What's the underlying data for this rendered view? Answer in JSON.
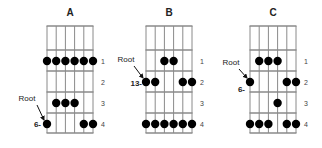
{
  "figure": {
    "colors": {
      "grid": "#8a8a8a",
      "dot": "#000000",
      "text": "#222222",
      "background": "#ffffff"
    },
    "diagrams": [
      {
        "title": "A",
        "fret_labels": [
          "1",
          "2",
          "3",
          "4"
        ],
        "root_label": "Root",
        "string_marker": "6-",
        "root": {
          "string": 1,
          "fret": 4
        },
        "dots": [
          {
            "string": 1,
            "fret": 1
          },
          {
            "string": 2,
            "fret": 1
          },
          {
            "string": 3,
            "fret": 1
          },
          {
            "string": 4,
            "fret": 1
          },
          {
            "string": 5,
            "fret": 1
          },
          {
            "string": 6,
            "fret": 1
          },
          {
            "string": 2,
            "fret": 3
          },
          {
            "string": 3,
            "fret": 3
          },
          {
            "string": 4,
            "fret": 3
          },
          {
            "string": 1,
            "fret": 4
          },
          {
            "string": 5,
            "fret": 4
          },
          {
            "string": 6,
            "fret": 4
          }
        ]
      },
      {
        "title": "B",
        "fret_labels": [
          "1",
          "2",
          "3",
          "4"
        ],
        "root_label": "Root",
        "string_marker": "13-",
        "root": {
          "string": 1,
          "fret": 2
        },
        "dots": [
          {
            "string": 3,
            "fret": 1
          },
          {
            "string": 4,
            "fret": 1
          },
          {
            "string": 1,
            "fret": 2
          },
          {
            "string": 2,
            "fret": 2
          },
          {
            "string": 5,
            "fret": 2
          },
          {
            "string": 6,
            "fret": 2
          },
          {
            "string": 1,
            "fret": 4
          },
          {
            "string": 2,
            "fret": 4
          },
          {
            "string": 3,
            "fret": 4
          },
          {
            "string": 4,
            "fret": 4
          },
          {
            "string": 5,
            "fret": 4
          },
          {
            "string": 6,
            "fret": 4
          }
        ]
      },
      {
        "title": "C",
        "fret_labels": [
          "1",
          "2",
          "3",
          "4"
        ],
        "root_label": "Root",
        "string_marker": "6-",
        "root": {
          "string": 1,
          "fret": 2
        },
        "dots": [
          {
            "string": 2,
            "fret": 1
          },
          {
            "string": 3,
            "fret": 1
          },
          {
            "string": 4,
            "fret": 1
          },
          {
            "string": 1,
            "fret": 2
          },
          {
            "string": 5,
            "fret": 2
          },
          {
            "string": 6,
            "fret": 2
          },
          {
            "string": 4,
            "fret": 3
          },
          {
            "string": 1,
            "fret": 4
          },
          {
            "string": 2,
            "fret": 4
          },
          {
            "string": 3,
            "fret": 4
          },
          {
            "string": 5,
            "fret": 4
          },
          {
            "string": 6,
            "fret": 4
          }
        ]
      }
    ]
  }
}
